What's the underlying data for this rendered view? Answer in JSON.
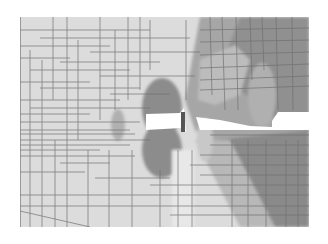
{
  "figure": {
    "type": "finite-element contour plot (grayscale)",
    "text_labels": [],
    "plot_area": {
      "x": 20,
      "y": 17,
      "width": 289,
      "height": 210
    },
    "colors": {
      "background": "#ffffff",
      "light_region": "#dcdcdc",
      "mid_region": "#b4b4b4",
      "dark_region": "#8c8c8c",
      "darkest_region": "#7a7a7a",
      "mesh_line": "#6e6e6e",
      "gap": "#ffffff"
    },
    "features": [
      {
        "name": "central-crack-gap",
        "shape": "rectangle-with-notch"
      },
      {
        "name": "right-crack-gap",
        "shape": "wedge"
      },
      {
        "name": "upper-lobe-dark",
        "shape": "ellipse"
      },
      {
        "name": "lower-lobe-dark",
        "shape": "ellipse"
      },
      {
        "name": "right-dark-region",
        "shape": "polygon"
      },
      {
        "name": "right-light-lobe",
        "shape": "ellipse"
      }
    ]
  }
}
